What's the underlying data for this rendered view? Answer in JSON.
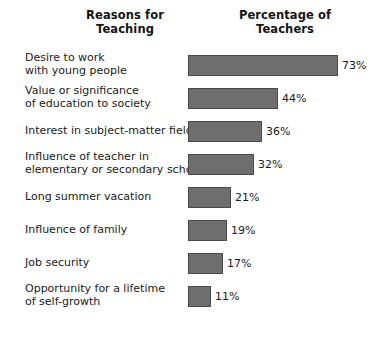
{
  "chart_data": {
    "type": "bar",
    "title": "",
    "orientation": "horizontal",
    "xlabel": "",
    "ylabel": "",
    "xlim": [
      0,
      73
    ],
    "grid": false,
    "legend": null,
    "value_suffix": "%",
    "bar_color": "#6e6e6e",
    "bar_border_color": "#4a4a4a",
    "background_color": "#ffffff",
    "text_color": "#1a1a1a",
    "px_per_unit": 2.05,
    "headers": {
      "category_column": [
        "Reasons for",
        "Teaching"
      ],
      "value_column": [
        "Percentage of",
        "Teachers"
      ]
    },
    "categories": [
      "Desire to work with young people",
      "Value or significance of education to society",
      "Interest in subject-matter field",
      "Influence of teacher in elementary or secondary school",
      "Long summer vacation",
      "Influence of family",
      "Job security",
      "Opportunity for a lifetime of self-growth"
    ],
    "values": [
      73,
      44,
      36,
      32,
      21,
      19,
      17,
      11
    ],
    "value_labels": [
      "73%",
      "44%",
      "36%",
      "32%",
      "21%",
      "19%",
      "17%",
      "11%"
    ],
    "rows": [
      {
        "label_lines": [
          "Desire to work",
          "with young people"
        ],
        "value": 73,
        "value_label": "73%"
      },
      {
        "label_lines": [
          "Value or significance",
          "of education to society"
        ],
        "value": 44,
        "value_label": "44%"
      },
      {
        "label_lines": [
          "Interest in subject-matter field"
        ],
        "value": 36,
        "value_label": "36%"
      },
      {
        "label_lines": [
          "Influence of teacher in",
          "elementary or secondary school"
        ],
        "value": 32,
        "value_label": "32%"
      },
      {
        "label_lines": [
          "Long summer vacation"
        ],
        "value": 21,
        "value_label": "21%"
      },
      {
        "label_lines": [
          "Influence of family"
        ],
        "value": 19,
        "value_label": "19%"
      },
      {
        "label_lines": [
          "Job security"
        ],
        "value": 17,
        "value_label": "17%"
      },
      {
        "label_lines": [
          "Opportunity for a lifetime",
          "of self-growth"
        ],
        "value": 11,
        "value_label": "11%"
      }
    ]
  }
}
